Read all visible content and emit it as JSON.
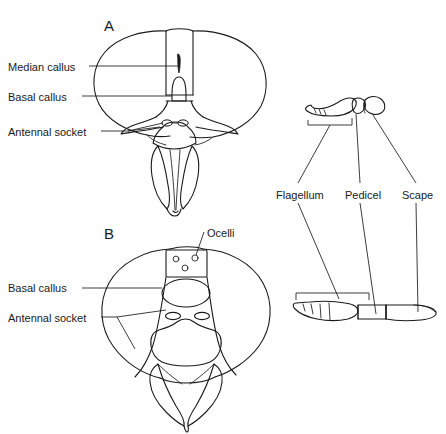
{
  "figure": {
    "type": "scientific-line-drawing",
    "background_color": "#ffffff",
    "ink_color": "#1a1a1a"
  },
  "panels": [
    {
      "id": "A",
      "letter": "A",
      "view": "frontal head view",
      "letter_pos": {
        "x": 104,
        "y": 18
      }
    },
    {
      "id": "B",
      "letter": "B",
      "view": "dorsal-frontal head view",
      "letter_pos": {
        "x": 104,
        "y": 226
      }
    }
  ],
  "labels": {
    "panel_a": [
      {
        "name": "median-callus",
        "text": "Median callus",
        "x": 8,
        "y": 61
      },
      {
        "name": "basal-callus",
        "text": "Basal callus",
        "x": 8,
        "y": 91
      },
      {
        "name": "antennal-socket",
        "text": "Antennal socket",
        "x": 8,
        "y": 126
      }
    ],
    "panel_b": [
      {
        "name": "ocelli",
        "text": "Ocelli",
        "x": 207,
        "y": 227
      },
      {
        "name": "basal-callus",
        "text": "Basal callus",
        "x": 8,
        "y": 282
      },
      {
        "name": "antennal-socket",
        "text": "Antennal socket",
        "x": 8,
        "y": 312
      }
    ],
    "antenna": [
      {
        "name": "flagellum",
        "text": "Flagellum",
        "x": 276,
        "y": 189
      },
      {
        "name": "pedicel",
        "text": "Pedicel",
        "x": 345,
        "y": 189
      },
      {
        "name": "scape",
        "text": "Scape",
        "x": 402,
        "y": 189
      }
    ]
  },
  "antenna_diagrams": [
    {
      "name": "antenna-folded-view",
      "description": "Antenna in resting / folded position, curved flagellum with apical segments",
      "segments": [
        "flagellum",
        "pedicel",
        "scape"
      ]
    },
    {
      "name": "antenna-extended-view",
      "description": "Antenna extended, showing segmented flagellum, pedicel and scape in line",
      "segments": [
        "flagellum",
        "pedicel",
        "scape"
      ]
    }
  ],
  "anatomical_features": {
    "compound_eyes": 2,
    "ocelli_count": 3,
    "antennal_sockets": 2,
    "callus_types": [
      "median callus",
      "basal callus"
    ]
  }
}
